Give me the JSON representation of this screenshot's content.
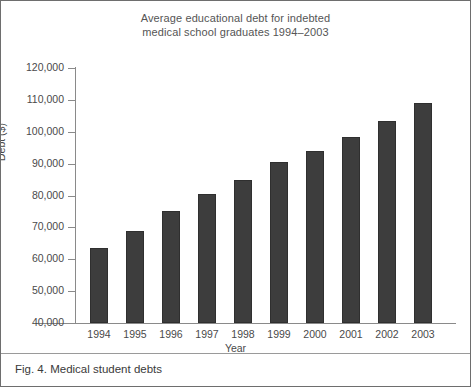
{
  "figure": {
    "caption": "Fig. 4. Medical student debts"
  },
  "chart_data": {
    "type": "bar",
    "title": "Average educational debt for indebted medical school graduates 1994–2003",
    "title_line1": "Average educational debt for indebted",
    "title_line2": "medical school graduates 1994–2003",
    "xlabel": "Year",
    "ylabel": "Debt ($)",
    "categories": [
      "1994",
      "1995",
      "1996",
      "1997",
      "1998",
      "1999",
      "2000",
      "2001",
      "2002",
      "2003"
    ],
    "values": [
      63500,
      69000,
      75000,
      80500,
      85000,
      90500,
      94000,
      98500,
      103500,
      109000
    ],
    "ylim": [
      40000,
      120000
    ],
    "ytick_values": [
      120000,
      110000,
      100000,
      90000,
      80000,
      70000,
      60000,
      50000,
      40000
    ],
    "ytick_labels": [
      "120,000",
      "110,000",
      "100,000",
      "90,000",
      "80,000",
      "70,000",
      "60,000",
      "50,000",
      "40,000"
    ],
    "grid": false,
    "legend": null,
    "bar_color": "#3d3d3d",
    "axis_color": "#8a8a8a",
    "text_color": "#4a4a4a"
  }
}
